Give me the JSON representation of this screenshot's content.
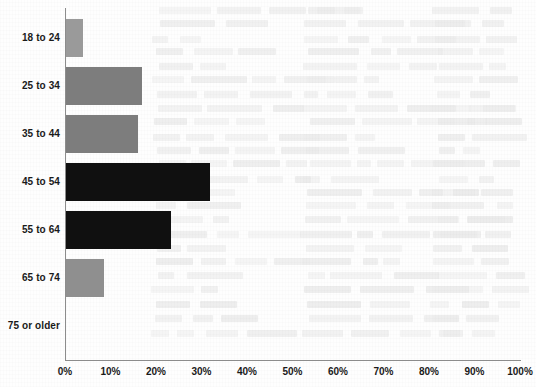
{
  "chart_data": {
    "type": "bar",
    "orientation": "horizontal",
    "title": "",
    "subtitle": "",
    "xlabel": "",
    "ylabel": "",
    "categories": [
      "18 to 24",
      "25 to 34",
      "35 to 44",
      "45 to 54",
      "55 to 64",
      "65 to 74",
      "75 or older"
    ],
    "values": [
      3.7,
      16.7,
      15.8,
      31.6,
      23.0,
      8.3,
      0
    ],
    "value_unit": "%",
    "xlim": [
      0,
      100
    ],
    "xticks": [
      0,
      10,
      20,
      30,
      40,
      50,
      60,
      70,
      80,
      90,
      100
    ],
    "xtick_labels": [
      "0%",
      "10%",
      "20%",
      "30%",
      "40%",
      "50%",
      "60%",
      "70%",
      "80%",
      "90%",
      "100%"
    ],
    "grid": false,
    "legend": null,
    "bar_colors": [
      "#9a9a9a",
      "#7d7d7d",
      "#7d7d7d",
      "#101010",
      "#101010",
      "#8f8f8f",
      "#ffffff"
    ],
    "series": [
      {
        "name": "Share of respondents",
        "values": [
          3.7,
          16.7,
          15.8,
          31.6,
          23.0,
          8.3,
          0
        ]
      }
    ]
  },
  "axes": {
    "axis_line_color": "#8c8c8c",
    "background_color": "#fefefe",
    "text_color": "#1a1a1a"
  },
  "background_ghost_text": [
    "faint bleed-through text from reverse of scanned page"
  ]
}
